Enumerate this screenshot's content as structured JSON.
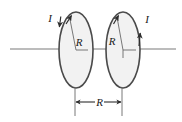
{
  "figure": {
    "colors": {
      "background": "#ffffff",
      "coil_stroke": "#4a4a4a",
      "coil_fill": "#f2f2f2",
      "axis_line": "#6e6e6e",
      "leader_line": "#555555",
      "dimension_line": "#3a3a3a",
      "label_text": "#1a1a1a"
    },
    "axis": {
      "name": "symmetry-axis",
      "x_start": 10,
      "x_end": 176,
      "y": 49
    },
    "coils": [
      {
        "id": "left-coil",
        "center_x": 76,
        "center_y": 50,
        "radius_x": 17,
        "radius_y": 38,
        "radius_label": "R",
        "radius_label_x": 79,
        "radius_label_y": 46,
        "current_label": "I",
        "current_label_x": 50,
        "current_label_y": 22
      },
      {
        "id": "right-coil",
        "center_x": 123,
        "center_y": 50,
        "radius_x": 17,
        "radius_y": 38,
        "radius_label": "R",
        "radius_label_x": 111,
        "radius_label_y": 45,
        "current_label": "I",
        "current_label_x": 146,
        "current_label_y": 22
      }
    ],
    "dimension": {
      "name": "coil-separation",
      "label": "R",
      "label_x": 99,
      "label_y": 106,
      "line_y": 102,
      "x_left": 75,
      "x_right": 122,
      "extension_top_y": 86,
      "extension_bottom_y": 116
    }
  }
}
